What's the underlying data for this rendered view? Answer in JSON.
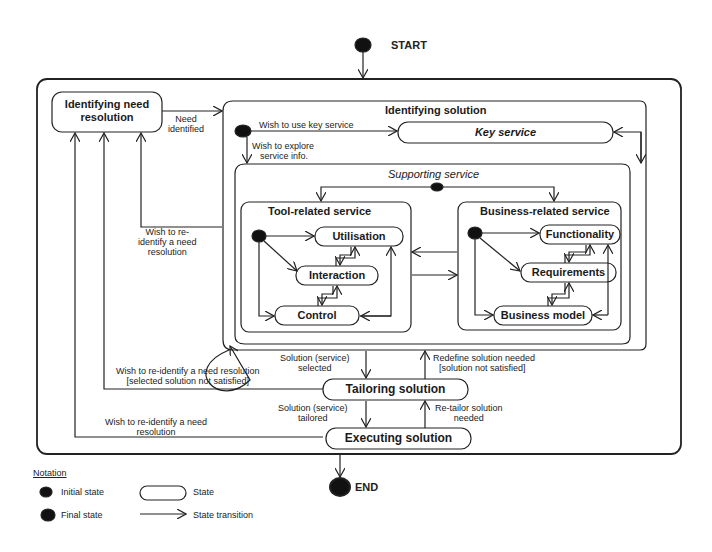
{
  "diagram": {
    "type": "UML state machine",
    "start_label": "START",
    "end_label": "END",
    "states": {
      "identifying_need": "Identifying need resolution",
      "identifying_need_line1": "Identifying need",
      "identifying_need_line2": "resolution",
      "identifying_solution": "Identifying solution",
      "key_service": "Key service",
      "supporting_service": "Supporting service",
      "tool_related": "Tool-related service",
      "business_related": "Business-related service",
      "utilisation": "Utilisation",
      "interaction": "Interaction",
      "control": "Control",
      "functionality": "Functionality",
      "requirements": "Requirements",
      "business_model": "Business model",
      "tailoring": "Tailoring solution",
      "executing": "Executing solution"
    },
    "transitions": {
      "need_identified_1": "Need",
      "need_identified_2": "identified",
      "use_key_service": "Wish to use key service",
      "explore_1": "Wish to explore",
      "explore_2": "service info.",
      "reidentify_a_1": "Wish to re-",
      "reidentify_a_2": "identify a need",
      "reidentify_a_3": "resolution",
      "reidentify_b_1": "Wish to re-identify a need resolution",
      "reidentify_b_2": "[selected solution not satisfied]",
      "reidentify_c_1": "Wish to re-identify a need",
      "reidentify_c_2": "resolution",
      "selected_1": "Solution (service)",
      "selected_2": "selected",
      "redefine_1": "Redefine solution needed",
      "redefine_2": "[solution not satisfied]",
      "tailored_1": "Solution (service)",
      "tailored_2": "tailored",
      "retailor_1": "Re-tailor solution",
      "retailor_2": "needed"
    },
    "notation": {
      "title": "Notation",
      "initial_state": "Initial state",
      "final_state": "Final state",
      "state": "State",
      "state_transition": "State transition"
    }
  }
}
